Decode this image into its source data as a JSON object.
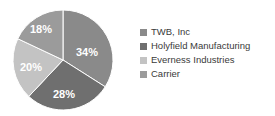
{
  "chart_data": {
    "type": "pie",
    "title": "",
    "subtitle": "",
    "xlabel": "",
    "ylabel": "",
    "grid": false,
    "legend_position": "right",
    "start_angle_deg": 0,
    "direction": "clockwise",
    "categories": [
      "TWB, Inc",
      "Holyfield Manufacturing",
      "Everness Industries",
      "Carrier"
    ],
    "values": [
      34,
      28,
      20,
      18
    ],
    "value_unit": "%",
    "data_labels": [
      "34%",
      "28%",
      "20%",
      "18%"
    ],
    "colors": [
      "#8a8a8a",
      "#6f6f6f",
      "#c3c3c3",
      "#9b9b9b"
    ],
    "slices": [
      {
        "label": "TWB, Inc",
        "value": 34,
        "data_label": "34%",
        "color": "#8a8a8a",
        "label_x": 87,
        "label_y": 53
      },
      {
        "label": "Holyfield Manufacturing",
        "value": 28,
        "data_label": "28%",
        "color": "#6f6f6f",
        "label_x": 64,
        "label_y": 95
      },
      {
        "label": "Everness Industries",
        "value": 20,
        "data_label": "20%",
        "color": "#c3c3c3",
        "label_x": 31,
        "label_y": 68
      },
      {
        "label": "Carrier",
        "value": 18,
        "data_label": "18%",
        "color": "#9b9b9b",
        "label_x": 41,
        "label_y": 30
      }
    ]
  },
  "legend": {
    "items": [
      {
        "label": "TWB, Inc",
        "color": "#8a8a8a"
      },
      {
        "label": "Holyfield Manufacturing",
        "color": "#6f6f6f"
      },
      {
        "label": "Everness Industries",
        "color": "#c3c3c3"
      },
      {
        "label": "Carrier",
        "color": "#9b9b9b"
      }
    ]
  },
  "geometry": {
    "center_x": 63,
    "center_y": 60,
    "radius": 50
  }
}
